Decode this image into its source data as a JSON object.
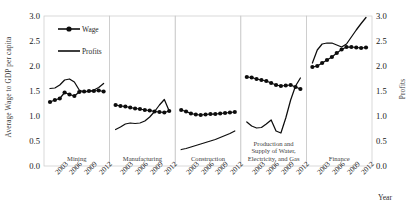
{
  "chart_data": {
    "type": "line",
    "title": "",
    "xlabel": "Year",
    "ylabel": "Average Wage to GDP per capita",
    "ylabel_right": "Profits",
    "ylim": [
      0.0,
      3.0
    ],
    "ylim_right": [
      0.0,
      3.0
    ],
    "yticks": [
      "0.0",
      "0.5",
      "1.0",
      "1.5",
      "2.0",
      "2.5",
      "3.0"
    ],
    "yticks_right": [
      "0.0",
      "0.5",
      "1.0",
      "1.5",
      "2.0",
      "2.5",
      "3.0"
    ],
    "xticks": [
      "2003",
      "2006",
      "2009",
      "2012"
    ],
    "x": [
      2002,
      2003,
      2004,
      2005,
      2006,
      2007,
      2008,
      2009,
      2010,
      2011,
      2012,
      2013
    ],
    "grid": false,
    "legend_position": "top-left",
    "legend": [
      {
        "name": "Wage",
        "marker": "circle-line",
        "color": "#0d0d0d"
      },
      {
        "name": "Profits",
        "marker": "line",
        "color": "#0d0d0d"
      }
    ],
    "panels": [
      {
        "label": "Mining",
        "label_lines": [
          "Mining"
        ],
        "series": [
          {
            "name": "Wage",
            "values": [
              1.28,
              1.32,
              1.35,
              1.47,
              1.43,
              1.4,
              1.48,
              1.49,
              1.5,
              1.5,
              1.51,
              1.49
            ]
          },
          {
            "name": "Profits",
            "values": [
              1.55,
              1.56,
              1.62,
              1.72,
              1.74,
              1.68,
              1.52,
              1.48,
              1.49,
              1.52,
              1.57,
              1.65
            ]
          }
        ]
      },
      {
        "label": "Manufacturing",
        "label_lines": [
          "Manufacturing"
        ],
        "series": [
          {
            "name": "Wage",
            "values": [
              1.22,
              1.2,
              1.19,
              1.17,
              1.15,
              1.14,
              1.12,
              1.11,
              1.09,
              1.08,
              1.07,
              1.1
            ]
          },
          {
            "name": "Profits",
            "values": [
              0.73,
              0.78,
              0.84,
              0.86,
              0.85,
              0.86,
              0.9,
              0.98,
              1.09,
              1.22,
              1.33,
              1.1
            ]
          }
        ]
      },
      {
        "label": "Construction",
        "label_lines": [
          "Construction"
        ],
        "series": [
          {
            "name": "Wage",
            "values": [
              1.12,
              1.09,
              1.05,
              1.03,
              1.02,
              1.03,
              1.04,
              1.04,
              1.05,
              1.06,
              1.07,
              1.08
            ]
          },
          {
            "name": "Profits",
            "values": [
              0.33,
              0.35,
              0.38,
              0.41,
              0.44,
              0.47,
              0.5,
              0.53,
              0.57,
              0.61,
              0.65,
              0.7
            ]
          }
        ]
      },
      {
        "label": "Production and Supply of Water, Electricity, and Gas",
        "label_lines": [
          "Production and",
          "Supply of Water,",
          "Electricity, and Gas"
        ],
        "series": [
          {
            "name": "Wage",
            "values": [
              1.78,
              1.77,
              1.74,
              1.72,
              1.7,
              1.66,
              1.62,
              1.6,
              1.61,
              1.62,
              1.58,
              1.54
            ]
          },
          {
            "name": "Profits",
            "values": [
              0.88,
              0.8,
              0.76,
              0.77,
              0.84,
              0.92,
              0.7,
              0.66,
              0.96,
              1.32,
              1.6,
              1.76
            ]
          }
        ]
      },
      {
        "label": "Finance",
        "label_lines": [
          "Finance"
        ],
        "series": [
          {
            "name": "Wage",
            "values": [
              1.98,
              2.0,
              2.06,
              2.12,
              2.18,
              2.26,
              2.33,
              2.38,
              2.38,
              2.37,
              2.36,
              2.37
            ]
          },
          {
            "name": "Profits",
            "values": [
              2.06,
              2.32,
              2.44,
              2.46,
              2.46,
              2.42,
              2.38,
              2.44,
              2.58,
              2.72,
              2.85,
              2.97
            ]
          }
        ]
      }
    ]
  }
}
